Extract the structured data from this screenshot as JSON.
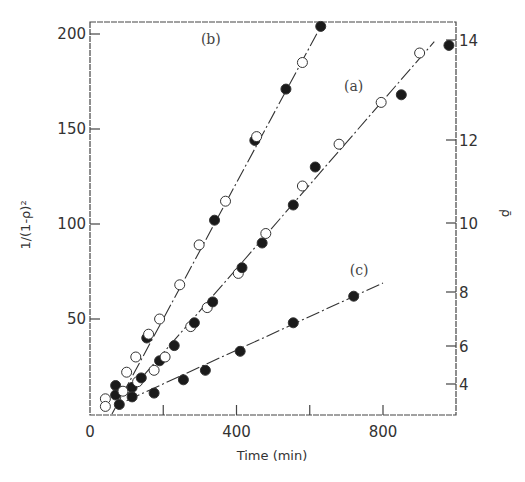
{
  "chart_data": {
    "type": "scatter",
    "title": "",
    "xlabel": "Time (min)",
    "ylabel": "1/(1-ρ)²",
    "ylabel_right": "ρ̄",
    "xlim": [
      0,
      1000
    ],
    "ylim": [
      0,
      206
    ],
    "x_ticks": [
      0,
      200,
      400,
      600,
      800
    ],
    "x_tick_labels": [
      "0",
      "",
      "400",
      "",
      "800"
    ],
    "y_ticks": [
      50,
      100,
      150,
      200
    ],
    "y_tick_labels": [
      "50",
      "100",
      "150",
      "200"
    ],
    "y_right_ticks": [
      4,
      6,
      8,
      10,
      12,
      14
    ],
    "y_right_tick_labels": [
      "4",
      "6",
      "8",
      "10",
      "12",
      "14"
    ],
    "grid": false,
    "legend": "none (curves labeled inline)",
    "marker_key": {
      "open": "open circle",
      "filled": "filled circle"
    },
    "series": [
      {
        "name": "(b)",
        "label_pos": [
          330,
          195
        ],
        "fit_line": {
          "x": [
            60,
            630
          ],
          "y": [
            0,
            204
          ]
        },
        "points": [
          {
            "x": 42,
            "y": 8,
            "marker": "open"
          },
          {
            "x": 42,
            "y": 4,
            "marker": "open"
          },
          {
            "x": 100,
            "y": 22,
            "marker": "open"
          },
          {
            "x": 125,
            "y": 30,
            "marker": "open"
          },
          {
            "x": 155,
            "y": 40,
            "marker": "filled"
          },
          {
            "x": 160,
            "y": 42,
            "marker": "open"
          },
          {
            "x": 190,
            "y": 50,
            "marker": "open"
          },
          {
            "x": 245,
            "y": 68,
            "marker": "open"
          },
          {
            "x": 298,
            "y": 89,
            "marker": "open"
          },
          {
            "x": 340,
            "y": 102,
            "marker": "filled"
          },
          {
            "x": 370,
            "y": 112,
            "marker": "open"
          },
          {
            "x": 450,
            "y": 144,
            "marker": "filled"
          },
          {
            "x": 455,
            "y": 146,
            "marker": "open"
          },
          {
            "x": 535,
            "y": 171,
            "marker": "filled"
          },
          {
            "x": 580,
            "y": 185,
            "marker": "open"
          },
          {
            "x": 630,
            "y": 204,
            "marker": "filled"
          }
        ]
      },
      {
        "name": "(a)",
        "label_pos": [
          720,
          170
        ],
        "fit_line": {
          "x": [
            100,
            940
          ],
          "y": [
            10,
            196
          ]
        },
        "points": [
          {
            "x": 70,
            "y": 15,
            "marker": "filled"
          },
          {
            "x": 70,
            "y": 10,
            "marker": "filled"
          },
          {
            "x": 80,
            "y": 5,
            "marker": "filled"
          },
          {
            "x": 90,
            "y": 12,
            "marker": "open"
          },
          {
            "x": 115,
            "y": 14,
            "marker": "filled"
          },
          {
            "x": 130,
            "y": 17,
            "marker": "open"
          },
          {
            "x": 140,
            "y": 19,
            "marker": "filled"
          },
          {
            "x": 175,
            "y": 23,
            "marker": "open"
          },
          {
            "x": 190,
            "y": 28,
            "marker": "filled"
          },
          {
            "x": 205,
            "y": 30,
            "marker": "open"
          },
          {
            "x": 230,
            "y": 36,
            "marker": "filled"
          },
          {
            "x": 275,
            "y": 46,
            "marker": "open"
          },
          {
            "x": 285,
            "y": 48,
            "marker": "filled"
          },
          {
            "x": 320,
            "y": 56,
            "marker": "open"
          },
          {
            "x": 335,
            "y": 59,
            "marker": "filled"
          },
          {
            "x": 405,
            "y": 74,
            "marker": "open"
          },
          {
            "x": 415,
            "y": 77,
            "marker": "filled"
          },
          {
            "x": 470,
            "y": 90,
            "marker": "filled"
          },
          {
            "x": 480,
            "y": 95,
            "marker": "open"
          },
          {
            "x": 555,
            "y": 110,
            "marker": "filled"
          },
          {
            "x": 580,
            "y": 120,
            "marker": "open"
          },
          {
            "x": 615,
            "y": 130,
            "marker": "filled"
          },
          {
            "x": 680,
            "y": 142,
            "marker": "open"
          },
          {
            "x": 795,
            "y": 164,
            "marker": "open"
          },
          {
            "x": 850,
            "y": 168,
            "marker": "filled"
          },
          {
            "x": 900,
            "y": 190,
            "marker": "open"
          },
          {
            "x": 980,
            "y": 194,
            "marker": "filled"
          }
        ]
      },
      {
        "name": "(c)",
        "label_pos": [
          735,
          73
        ],
        "fit_line": {
          "x": [
            100,
            800
          ],
          "y": [
            7,
            69
          ]
        },
        "points": [
          {
            "x": 115,
            "y": 9,
            "marker": "filled"
          },
          {
            "x": 175,
            "y": 11,
            "marker": "filled"
          },
          {
            "x": 255,
            "y": 18,
            "marker": "filled"
          },
          {
            "x": 315,
            "y": 23,
            "marker": "filled"
          },
          {
            "x": 410,
            "y": 33,
            "marker": "filled"
          },
          {
            "x": 555,
            "y": 48,
            "marker": "filled"
          },
          {
            "x": 720,
            "y": 62,
            "marker": "filled"
          }
        ]
      }
    ]
  }
}
